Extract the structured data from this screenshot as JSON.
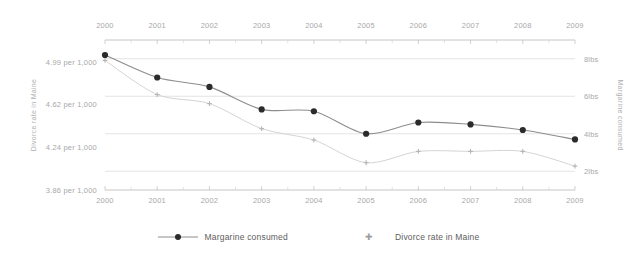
{
  "chart_data": {
    "type": "line",
    "title": "",
    "subtitle": "",
    "xlabel": "",
    "x": [
      2000,
      2001,
      2002,
      2003,
      2004,
      2005,
      2006,
      2007,
      2008,
      2009
    ],
    "x_tick_labels_top": [
      "2000",
      "2001",
      "2002",
      "2003",
      "2004",
      "2005",
      "2006",
      "2007",
      "2008",
      "2009"
    ],
    "x_tick_labels_bottom": [
      "2000",
      "2001",
      "2002",
      "2003",
      "2004",
      "2005",
      "2006",
      "2007",
      "2008",
      "2009"
    ],
    "grid": true,
    "legend_position": "bottom",
    "axes": {
      "left": {
        "label": "Divorce rate in Maine",
        "tick_labels": [
          "4.99 per 1,000",
          "4.62 per 1,000",
          "4.24 per 1,000",
          "3.86 per 1,000"
        ],
        "tick_values": [
          4.99,
          4.62,
          4.24,
          3.86
        ],
        "ylim": [
          3.86,
          5.18
        ]
      },
      "right": {
        "label": "Margarine consumed",
        "tick_labels": [
          "8lbs",
          "6lbs",
          "4lbs",
          "2lbs"
        ],
        "tick_values": [
          8,
          6,
          4,
          2
        ],
        "ylim": [
          1,
          9
        ]
      }
    },
    "series": [
      {
        "name": "Margarine consumed",
        "axis": "right",
        "unit": "lbs",
        "color": "#2b2b2b",
        "line_color": "#8d8d8d",
        "marker": "circle",
        "values": [
          8.2,
          7.0,
          6.5,
          5.3,
          5.2,
          4.0,
          4.6,
          4.5,
          4.2,
          3.7
        ]
      },
      {
        "name": "Divorce rate in Maine",
        "axis": "left",
        "unit": "per 1,000",
        "color": "#b4b4b4",
        "line_color": "#cfcfcf",
        "marker": "cross",
        "values": [
          5.0,
          4.7,
          4.62,
          4.4,
          4.3,
          4.1,
          4.2,
          4.2,
          4.2,
          4.07
        ]
      }
    ]
  },
  "legend": {
    "items": [
      {
        "label": "Margarine consumed"
      },
      {
        "label": "Divorce rate in Maine"
      }
    ]
  }
}
